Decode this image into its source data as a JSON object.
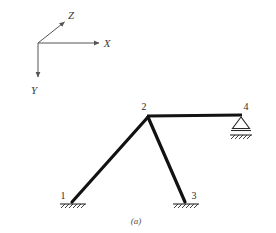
{
  "figure": {
    "caption": "(a)",
    "background_color": "#ffffff",
    "member_color": "#121212",
    "axis_color": "#555555",
    "support_color": "#2a2a2a"
  },
  "axes": {
    "origin": {
      "x": 38,
      "y": 43
    },
    "items": [
      {
        "name": "x-axis",
        "label": "X",
        "tip": {
          "x": 101,
          "y": 43
        },
        "label_pos": {
          "x": 107,
          "y": 47
        }
      },
      {
        "name": "y-axis",
        "label": "Y",
        "tip": {
          "x": 38,
          "y": 79
        },
        "label_pos": {
          "x": 34,
          "y": 94
        }
      },
      {
        "name": "z-axis",
        "label": "Z",
        "tip": {
          "x": 66,
          "y": 20
        },
        "label_pos": {
          "x": 70,
          "y": 18
        }
      }
    ]
  },
  "structure": {
    "nodes": [
      {
        "id": "1",
        "label": "1",
        "x": 72,
        "y": 202,
        "label_pos": {
          "x": 63,
          "y": 198
        },
        "support": "fixed-ground"
      },
      {
        "id": "2",
        "label": "2",
        "x": 148,
        "y": 116,
        "label_pos": {
          "x": 143,
          "y": 110
        },
        "support": "none"
      },
      {
        "id": "3",
        "label": "3",
        "x": 185,
        "y": 202,
        "label_pos": {
          "x": 192,
          "y": 198
        },
        "support": "fixed-ground"
      },
      {
        "id": "4",
        "label": "4",
        "x": 241,
        "y": 115,
        "label_pos": {
          "x": 245,
          "y": 110
        },
        "support": "roller-triangle"
      }
    ],
    "members": [
      {
        "name": "member-1-2",
        "from": "1",
        "to": "2",
        "style": "thick"
      },
      {
        "name": "member-2-3",
        "from": "2",
        "to": "3",
        "style": "thick"
      },
      {
        "name": "member-2-4",
        "from": "2",
        "to": "4",
        "style": "beam"
      }
    ]
  },
  "supports": {
    "ground_1": {
      "center_x": 72,
      "y": 204,
      "half_width": 13,
      "hatch_count": 6
    },
    "ground_3": {
      "center_x": 185,
      "y": 204,
      "half_width": 13,
      "hatch_count": 6
    },
    "roller_4": {
      "apex_x": 241,
      "apex_y": 117,
      "base_y": 129,
      "half_width": 9,
      "ground_y": 133,
      "hatch_count": 6
    }
  }
}
